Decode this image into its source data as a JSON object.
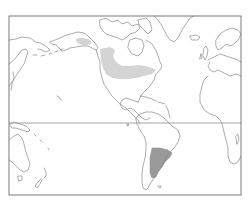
{
  "map": {
    "projection": "Americas-centered world map",
    "frame": {
      "left": 9,
      "top": 16,
      "right": 241,
      "bottom": 195
    },
    "equator_y": 123,
    "colors": {
      "background": "#ffffff",
      "coastline": "#8a8a8a",
      "frame": "#7a7a7a",
      "light_range": "#d4d4d4",
      "dark_range": "#9a9a9a"
    },
    "regions": [
      {
        "name": "alaska-yukon-range",
        "style": "light"
      },
      {
        "name": "western-canada-prairie-range",
        "style": "light"
      },
      {
        "name": "great-lakes-range",
        "style": "light"
      },
      {
        "name": "argentina-uruguay-range",
        "style": "dark"
      }
    ]
  }
}
